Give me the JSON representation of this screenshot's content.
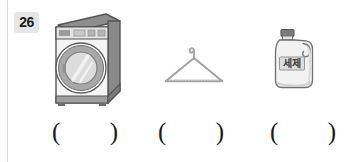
{
  "worksheet": {
    "question_number": "26",
    "items": [
      {
        "id": "washing-machine",
        "icon_name": "washing-machine-illustration",
        "label": ""
      },
      {
        "id": "clothes-hanger",
        "icon_name": "clothes-hanger-illustration",
        "label": ""
      },
      {
        "id": "detergent-bottle",
        "icon_name": "detergent-bottle-illustration",
        "label": "세제"
      }
    ],
    "answer_blanks": [
      {
        "open": "(",
        "close": ")"
      },
      {
        "open": "(",
        "close": ")"
      },
      {
        "open": "(",
        "close": ")"
      }
    ]
  },
  "colors": {
    "page_background": "#ffffff",
    "rule": "#d9d9d9",
    "badge_background": "#e6e6e6",
    "text": "#1a1a1a",
    "outline_dark": "#5a5a5a",
    "gray_mid": "#9a9a9a",
    "gray_light": "#d5d5d5",
    "gray_lighter": "#ededed",
    "cap_dark": "#6e6e6e"
  }
}
